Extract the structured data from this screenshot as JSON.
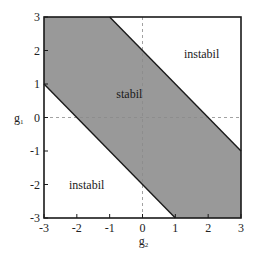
{
  "chart_data": {
    "type": "area",
    "title": "",
    "xlabel": "g2",
    "ylabel": "g1",
    "xlabel_main": "g",
    "xlabel_sub": "2",
    "ylabel_main": "g",
    "ylabel_sub": "1",
    "xlim": [
      -3,
      3
    ],
    "ylim": [
      -3,
      3
    ],
    "x_ticks": [
      -3,
      -2,
      -1,
      0,
      1,
      2,
      3
    ],
    "y_ticks": [
      -3,
      -2,
      -1,
      0,
      1,
      2,
      3
    ],
    "x_tick_labels": [
      "-3",
      "-2",
      "-1",
      "0",
      "1",
      "2",
      "3"
    ],
    "y_tick_labels": [
      "-3",
      "-2",
      "-1",
      "0",
      "1",
      "2",
      "3"
    ],
    "grid": false,
    "reference_lines": [
      {
        "orientation": "vertical",
        "x": 0,
        "style": "dashed"
      },
      {
        "orientation": "horizontal",
        "y": 0,
        "style": "dashed"
      }
    ],
    "regions": [
      {
        "name": "stabil",
        "fill": "#999999",
        "description": "-2 <= g1 + g2 <= 2",
        "polygon": [
          [
            -3,
            3
          ],
          [
            -1,
            3
          ],
          [
            3,
            -1
          ],
          [
            3,
            -3
          ],
          [
            1,
            -3
          ],
          [
            -3,
            1
          ]
        ]
      },
      {
        "name": "instabil",
        "fill": "#ffffff",
        "description": "g1 + g2 > 2",
        "polygon": [
          [
            -1,
            3
          ],
          [
            3,
            3
          ],
          [
            3,
            -1
          ]
        ]
      },
      {
        "name": "instabil",
        "fill": "#ffffff",
        "description": "g1 + g2 < -2",
        "polygon": [
          [
            -3,
            1
          ],
          [
            -3,
            -3
          ],
          [
            1,
            -3
          ]
        ]
      }
    ],
    "boundaries": [
      {
        "equation": "g1 = 2 - g2",
        "from": [
          -1,
          3
        ],
        "to": [
          3,
          -1
        ]
      },
      {
        "equation": "g1 = -2 - g2",
        "from": [
          -3,
          1
        ],
        "to": [
          1,
          -3
        ]
      }
    ],
    "annotations": [
      {
        "text": "stabil",
        "x": -0.4,
        "y": 0.7
      },
      {
        "text": "instabil",
        "x": 1.8,
        "y": 1.9
      },
      {
        "text": "instabil",
        "x": -1.7,
        "y": -2.0
      }
    ]
  },
  "labels": {
    "stable": "stabil",
    "unstable_upper": "instabil",
    "unstable_lower": "instabil"
  },
  "colors": {
    "stable_fill": "#999999",
    "frame": "#1a1a1a",
    "dash": "#8a8a8a"
  }
}
